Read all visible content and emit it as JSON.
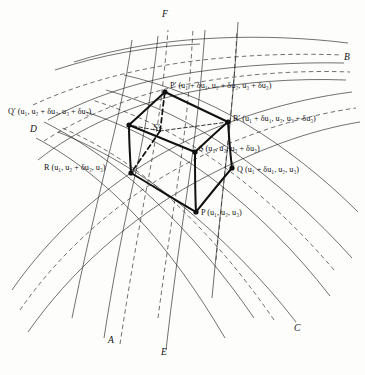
{
  "figure": {
    "type": "curvilinear-coordinate-cell-diagram",
    "background_color": "#fdfdfc",
    "ink_color": "#111111"
  },
  "vertices": [
    {
      "id": "P",
      "label_italic": "P",
      "prime": "",
      "coords": "(u1, u2, u3)",
      "text": "P (u₁, u₂, u₃)",
      "x": 196,
      "y": 212,
      "label_x": 201,
      "label_y": 215,
      "hidden": false,
      "dot": true
    },
    {
      "id": "Q",
      "label_italic": "Q",
      "prime": "",
      "coords": "(u1 + du1, u2, u3)",
      "text": "Q (u₁ + δu₁, u₂, u₃)",
      "x": 232,
      "y": 168,
      "label_x": 236,
      "label_y": 170,
      "hidden": false,
      "dot": true
    },
    {
      "id": "R",
      "label_italic": "R",
      "prime": "",
      "coords": "(u1, u2 + du2, u3)",
      "text": "R (u₁, u₂ + δu₂, u₃)",
      "x": 131,
      "y": 173,
      "label_x": 46,
      "label_y": 168,
      "hidden": false,
      "dot": true
    },
    {
      "id": "S",
      "label_italic": "S",
      "prime": "",
      "coords": "(u1, u2, u3 + du3)",
      "text": "S (u₁, u₂, u₃ + δu₃)",
      "x": 195,
      "y": 152,
      "label_x": 199,
      "label_y": 149,
      "hidden": false,
      "dot": true
    },
    {
      "id": "Pprime",
      "label_italic": "P",
      "prime": "′",
      "coords": "(u1 + du1, u2 + du2, u3 + du3)",
      "text": "P′ (u₁ + δu₁, u₂ + δu₂, u₃ + δu₃)",
      "x": 165,
      "y": 92,
      "label_x": 170,
      "label_y": 86,
      "hidden": false,
      "dot": true
    },
    {
      "id": "Qprime",
      "label_italic": "Q",
      "prime": "′",
      "coords": "(u1, u2 + du2, u3 + du3)",
      "text": "Q′ (u₁, u₂ + δu₂, u₃ + δu₃)",
      "x": 129,
      "y": 125,
      "label_x": 11,
      "label_y": 113,
      "hidden": false,
      "dot": true
    },
    {
      "id": "Rprime",
      "label_italic": "R",
      "prime": "′",
      "coords": "(u1 + du1, u2, u3 + du3)",
      "text": "R′ (u₁ + δu₁, u₂, u₃ + δu₃)",
      "x": 228,
      "y": 122,
      "label_x": 233,
      "label_y": 119,
      "hidden": false,
      "dot": true
    },
    {
      "id": "Sprime",
      "label_italic": "S",
      "prime": "′",
      "coords": "",
      "text": "S′",
      "x": 160,
      "y": 131,
      "label_x": 156,
      "label_y": 126,
      "hidden": true,
      "dot": false
    }
  ],
  "curve_labels": [
    {
      "id": "A",
      "text": "A",
      "x": 108,
      "y": 341
    },
    {
      "id": "B",
      "text": "B",
      "x": 344,
      "y": 58
    },
    {
      "id": "C",
      "text": "C",
      "x": 294,
      "y": 329
    },
    {
      "id": "D",
      "text": "D",
      "x": 30,
      "y": 130
    },
    {
      "id": "E",
      "text": "E",
      "x": 161,
      "y": 353
    },
    {
      "id": "F",
      "text": "F",
      "x": 162,
      "y": 15
    }
  ],
  "cube_edges_solid": [
    "P-Q",
    "P-R",
    "P-S",
    "Q-Rprime",
    "R-Qprime",
    "S-Rprime",
    "S-Qprime",
    "Qprime-Pprime",
    "Rprime-Pprime"
  ],
  "cube_edges_dashed": [
    "Sprime-Pprime",
    "Sprime-R",
    "Sprime-Q",
    "Sprime-Qprime",
    "Sprime-Rprime"
  ],
  "curve_families": {
    "family_1_label": "A to B",
    "family_2_label": "C to D",
    "family_3_label": "E to F",
    "solid_count": 6,
    "dashed_count": 5
  }
}
